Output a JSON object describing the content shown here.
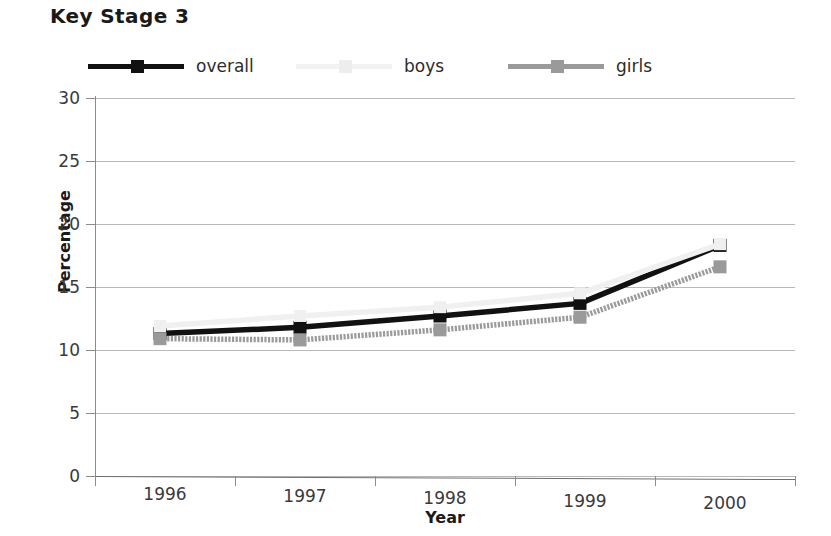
{
  "title": "Key Stage 3",
  "axis": {
    "ylabel": "Percentage",
    "xlabel": "Year"
  },
  "legend": {
    "items": [
      {
        "label": "overall",
        "color": "#111111",
        "marker": "square",
        "swatch_name": "legend-swatch-overall"
      },
      {
        "label": "boys",
        "color": "#f0f0f0",
        "marker": "square",
        "swatch_name": "legend-swatch-boys"
      },
      {
        "label": "girls",
        "color": "#9a9a9a",
        "marker": "square",
        "swatch_name": "legend-swatch-girls"
      }
    ]
  },
  "chart_data": {
    "type": "line",
    "title": "Key Stage 3",
    "xlabel": "Year",
    "ylabel": "Percentage",
    "categories": [
      "1996",
      "1997",
      "1998",
      "1999",
      "2000"
    ],
    "x": [
      1996,
      1997,
      1998,
      1999,
      2000
    ],
    "ylim": [
      0,
      30
    ],
    "yticks": [
      0,
      5,
      10,
      15,
      20,
      25,
      30
    ],
    "ytick_labels": [
      "0",
      "5",
      "10",
      "15",
      "20",
      "25",
      "30"
    ],
    "grid": true,
    "grid_axis": "y",
    "legend_position": "top",
    "series": [
      {
        "name": "overall",
        "color": "#111111",
        "values": [
          11.3,
          11.8,
          12.7,
          13.7,
          18.3
        ]
      },
      {
        "name": "boys",
        "color": "#f0f0f0",
        "values": [
          11.9,
          12.7,
          13.4,
          14.5,
          18.4
        ]
      },
      {
        "name": "girls",
        "color": "#9a9a9a",
        "values": [
          10.9,
          10.8,
          11.6,
          12.6,
          16.6
        ]
      }
    ]
  }
}
